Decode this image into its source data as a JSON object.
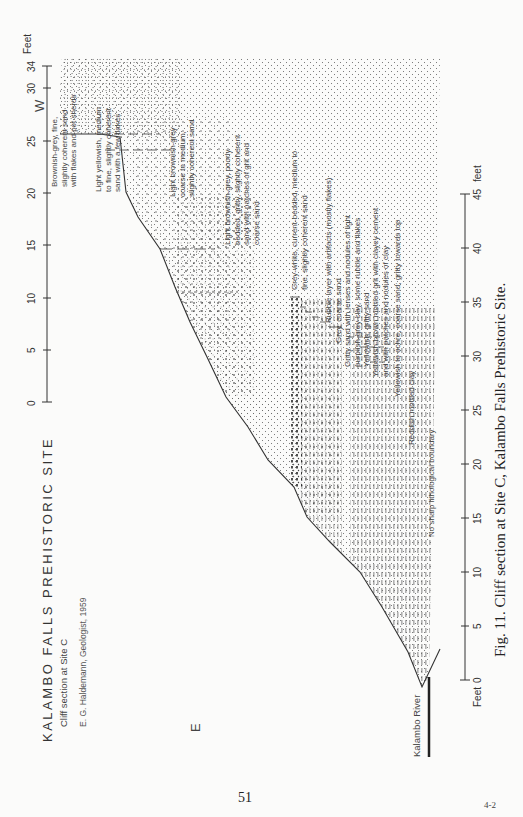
{
  "figure": {
    "title": "KALAMBO FALLS PREHISTORIC SITE",
    "subtitle": "Cliff section at Site C",
    "author": "E. G. Haldemann, Geologist, 1959",
    "caption": "Fig. 11. Cliff section at Site C, Kalambo Falls Prehistoric Site.",
    "direction_left": "E",
    "direction_right": "W",
    "river_label": "Kalambo River",
    "page_number": "51",
    "signature_mark": "4-2"
  },
  "vertical_axis": {
    "unit_label": "Feet",
    "ticks": [
      "0",
      "5",
      "10",
      "15",
      "20",
      "25",
      "30",
      "34"
    ]
  },
  "horizontal_axis": {
    "origin_label": "Feet",
    "unit_label": "feet",
    "ticks": [
      "0",
      "5",
      "10",
      "15",
      "20",
      "25",
      "30",
      "35",
      "40",
      "45"
    ]
  },
  "layers": [
    {
      "id": "top",
      "label": [
        "Brownish-grey, fine,",
        "slightly coherent sand",
        "with flakes and pot sherds"
      ]
    },
    {
      "id": "yellow",
      "label": [
        "Light yellowish, medium",
        "to fine, slightly coherent",
        "sand with a few flakes"
      ]
    },
    {
      "id": "brown-coarse",
      "label": [
        "Light brownish-grey",
        "coarse to medium,",
        "slightly coherent sand"
      ]
    },
    {
      "id": "brown-gritty",
      "label": [
        "Light brownish-grey, poorly",
        "bedded, gritty, slightly coherent",
        "sand with patches of grit and",
        "coarse sand"
      ]
    },
    {
      "id": "grey-white",
      "label": [
        "Grey-white, current-bedded, medium to",
        "fine, slightly coherent sand"
      ]
    },
    {
      "id": "rubble",
      "label": [
        "Rubble layer with artifacts (mostly flakes)"
      ]
    },
    {
      "id": "grey-coarse",
      "label": [
        "Grey, coarse sand"
      ]
    },
    {
      "id": "gritty-lenses",
      "label": [
        "Gritty sand with lenses and nodules of light",
        "purplish-grey clay, some rubble and flakes"
      ]
    },
    {
      "id": "yellowish-gritty",
      "label": [
        "Yellowish, gritty sand"
      ]
    },
    {
      "id": "yellowish-brown",
      "label": [
        "Yellowish-brown mottled grit with clayey cement",
        "and with patches and nodules of clay"
      ]
    },
    {
      "id": "ochre",
      "label": [
        "Yellowish to ochre, coarse sand; gritty towards top"
      ]
    },
    {
      "id": "boundary-note",
      "label": [
        "No sharp lithological boundary"
      ]
    },
    {
      "id": "reddish-clay",
      "label": [
        "Reddish mottled clay"
      ]
    }
  ]
}
